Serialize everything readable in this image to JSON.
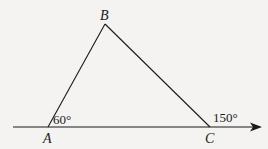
{
  "diagram": {
    "type": "geometry",
    "colors": {
      "background": "#f4f3f1",
      "stroke": "#1a1a1a"
    },
    "vertices": {
      "A": {
        "label": "A",
        "x": 48,
        "y": 127
      },
      "B": {
        "label": "B",
        "x": 105,
        "y": 24
      },
      "C": {
        "label": "C",
        "x": 210,
        "y": 127
      }
    },
    "ray": {
      "x1": 13,
      "y1": 127,
      "x2": 262,
      "y2": 127
    },
    "angles": [
      {
        "at": "A",
        "label": "60°",
        "description": "interior angle BAC"
      },
      {
        "at": "C",
        "label": "150°",
        "description": "exterior angle at C"
      }
    ]
  }
}
